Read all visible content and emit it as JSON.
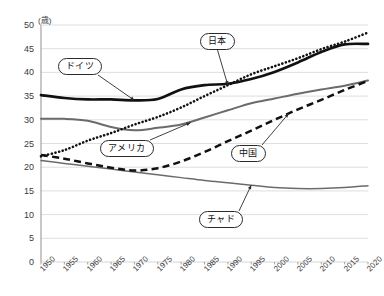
{
  "chart_data": {
    "type": "line",
    "title": "",
    "subtitle": "",
    "xlabel": "",
    "ylabel": "",
    "unit_label": "(歳)",
    "grid": true,
    "legend_position": "inline-callouts",
    "xlim": [
      1950,
      2020
    ],
    "ylim": [
      0,
      50
    ],
    "ytick_step": 5,
    "x": [
      1950,
      1955,
      1960,
      1965,
      1970,
      1975,
      1980,
      1985,
      1990,
      1995,
      2000,
      2005,
      2010,
      2015,
      2020
    ],
    "categories": [
      "1950",
      "1955",
      "1960",
      "1965",
      "1970",
      "1975",
      "1980",
      "1985",
      "1990",
      "1995",
      "2000",
      "2005",
      "2010",
      "2015",
      "2020"
    ],
    "yticks": [
      "0",
      "5",
      "10",
      "15",
      "20",
      "25",
      "30",
      "35",
      "40",
      "45",
      "50"
    ],
    "series": [
      {
        "name": "日本",
        "style": "dotted",
        "color": "#111111",
        "values": [
          22.3,
          23.6,
          25.6,
          27.2,
          29.0,
          30.6,
          32.6,
          35.0,
          37.3,
          39.6,
          41.3,
          43.0,
          44.9,
          46.5,
          48.4
        ]
      },
      {
        "name": "ドイツ",
        "style": "solid-thick",
        "color": "#111111",
        "values": [
          35.2,
          34.6,
          34.3,
          34.3,
          34.1,
          34.4,
          36.4,
          37.3,
          37.6,
          38.6,
          40.1,
          42.1,
          44.3,
          45.9,
          46.0
        ]
      },
      {
        "name": "中国",
        "style": "solid-medium",
        "color": "#6b6b6b",
        "values": [
          30.2,
          30.2,
          29.8,
          28.5,
          27.8,
          28.3,
          29.0,
          30.5,
          32.0,
          33.5,
          34.5,
          35.5,
          36.4,
          37.2,
          38.3
        ]
      },
      {
        "name": "アメリカ",
        "style": "dashed",
        "color": "#111111",
        "values": [
          22.6,
          21.8,
          20.8,
          19.9,
          19.3,
          19.8,
          21.2,
          23.2,
          25.5,
          27.7,
          30.0,
          32.2,
          34.2,
          36.3,
          38.2
        ]
      },
      {
        "name": "チャド",
        "style": "solid-thin",
        "color": "#6b6b6b",
        "values": [
          21.4,
          20.8,
          20.2,
          19.6,
          19.0,
          18.4,
          17.8,
          17.2,
          16.7,
          16.2,
          15.7,
          15.5,
          15.5,
          15.7,
          16.1
        ]
      }
    ],
    "annotations": [
      {
        "label": "ドイツ",
        "points_to_year": 1970,
        "points_to_value": 34.1
      },
      {
        "label": "日本",
        "points_to_year": 1990,
        "points_to_value": 37.3
      },
      {
        "label": "アメリカ",
        "points_to_year": 1982,
        "points_to_value": 29.4
      },
      {
        "label": "中国",
        "points_to_year": 2003,
        "points_to_value": 31.3
      },
      {
        "label": "チャド",
        "points_to_year": 1995,
        "points_to_value": 16.2
      }
    ]
  }
}
